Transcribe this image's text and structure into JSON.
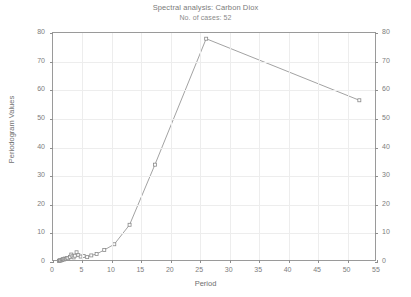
{
  "chart_data": {
    "type": "line",
    "title": "Spectral analysis: Carbon Diox",
    "subtitle": "No. of cases: 52",
    "xlabel": "Period",
    "ylabel": "Periodogram Values",
    "xlim": [
      0,
      55
    ],
    "ylim": [
      0,
      80
    ],
    "xticks": [
      0,
      5,
      10,
      15,
      20,
      25,
      30,
      35,
      40,
      45,
      50,
      55
    ],
    "yticks": [
      0,
      10,
      20,
      30,
      40,
      50,
      60,
      70,
      80
    ],
    "y2ticks": [
      0,
      10,
      20,
      30,
      40,
      50,
      60,
      70,
      80
    ],
    "grid": true,
    "legend": "none",
    "marker": "square",
    "line_color": "#8a8a8a",
    "marker_color": "#8a8a8a",
    "grid_color": "#ededed",
    "axis_color": "#9a9a9a",
    "text_color": "#7a7a7a",
    "background": "#ffffff",
    "x": [
      1.0,
      1.1,
      1.2,
      1.3,
      1.5,
      1.6,
      1.7,
      1.9,
      2.0,
      2.2,
      2.4,
      2.6,
      2.9,
      3.1,
      3.3,
      3.5,
      3.7,
      4.0,
      4.3,
      4.7,
      5.2,
      5.8,
      6.5,
      7.4,
      8.7,
      10.4,
      13.0,
      17.3,
      26.0,
      52.0
    ],
    "y": [
      0.4,
      0.5,
      0.6,
      0.5,
      0.8,
      0.7,
      1.0,
      0.9,
      1.2,
      1.1,
      1.4,
      1.3,
      1.8,
      2.6,
      2.0,
      1.6,
      2.2,
      3.4,
      2.4,
      1.9,
      2.1,
      1.7,
      2.3,
      2.8,
      4.2,
      6.2,
      13.0,
      34.0,
      78.0,
      56.5
    ],
    "annotations": [
      {
        "label": "peak",
        "x": 26.0,
        "y": 78.0
      },
      {
        "label": "final",
        "x": 52.0,
        "y": 56.5
      }
    ]
  },
  "axes": {
    "y_left_labels": [
      "0",
      "10",
      "20",
      "30",
      "40",
      "50",
      "60",
      "70",
      "80"
    ],
    "y_right_labels": [
      "0",
      "10",
      "20",
      "30",
      "40",
      "50",
      "60",
      "70",
      "80"
    ],
    "x_labels": [
      "0",
      "5",
      "10",
      "15",
      "20",
      "25",
      "30",
      "35",
      "40",
      "45",
      "50",
      "55"
    ]
  }
}
